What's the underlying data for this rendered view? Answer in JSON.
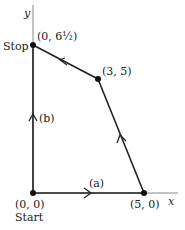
{
  "axes": {
    "x_label": "x",
    "y_label": "y"
  },
  "points": [
    {
      "id": "start",
      "coord": "(0, 0)",
      "name": "Start"
    },
    {
      "id": "p1",
      "coord": "(5, 0)"
    },
    {
      "id": "p2",
      "coord": "(3, 5)"
    },
    {
      "id": "stop",
      "coord": "(0, 6½)",
      "name": "Stop"
    }
  ],
  "path_labels": {
    "a": "(a)",
    "b": "(b)"
  },
  "colors": {
    "line": "#222222",
    "axis": "#999999"
  }
}
